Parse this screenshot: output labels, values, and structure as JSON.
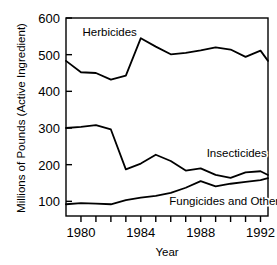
{
  "chart_data": {
    "type": "line",
    "title": "",
    "xlabel": "Year",
    "ylabel": "Millions of Pounds (Active Ingredient)",
    "xlim": [
      1979,
      1992.5
    ],
    "ylim": [
      60,
      600
    ],
    "grid": false,
    "legend_position": "inline-annotations",
    "x_ticks_major": [
      1980,
      1984,
      1988,
      1992
    ],
    "x_tick_labels": [
      "1980",
      "1984",
      "1988",
      "1992"
    ],
    "x_ticks_all": [
      1980,
      1981,
      1982,
      1983,
      1984,
      1985,
      1986,
      1987,
      1988,
      1989,
      1990,
      1991,
      1992
    ],
    "y_ticks": [
      100,
      200,
      300,
      400,
      500,
      600
    ],
    "y_tick_labels": [
      "100",
      "200",
      "300",
      "400",
      "500",
      "600"
    ],
    "x": [
      1979,
      1980,
      1981,
      1982,
      1983,
      1984,
      1985,
      1986,
      1987,
      1988,
      1989,
      1990,
      1991,
      1992,
      1992.5
    ],
    "series": [
      {
        "name": "Herbicides",
        "label_x": 1980.1,
        "label_y": 562,
        "values": [
          483,
          452,
          450,
          432,
          443,
          545,
          522,
          501,
          505,
          512,
          520,
          514,
          494,
          511,
          483
        ]
      },
      {
        "name": "Insecticides",
        "label_x": 1988.4,
        "label_y": 232,
        "values": [
          300,
          303,
          308,
          296,
          187,
          203,
          227,
          210,
          184,
          190,
          172,
          164,
          179,
          182,
          172
        ]
      },
      {
        "name": "Fungicides and Other*",
        "label_x": 1985.9,
        "label_y": 100,
        "values": [
          92,
          95,
          94,
          92,
          103,
          110,
          115,
          123,
          137,
          155,
          141,
          148,
          153,
          158,
          163
        ]
      }
    ]
  },
  "axes": {
    "x_title": "Year",
    "y_title": "Millions of Pounds (Active Ingredient)"
  },
  "colors": {
    "line": "#000000",
    "axis": "#000000",
    "background": "#ffffff"
  }
}
